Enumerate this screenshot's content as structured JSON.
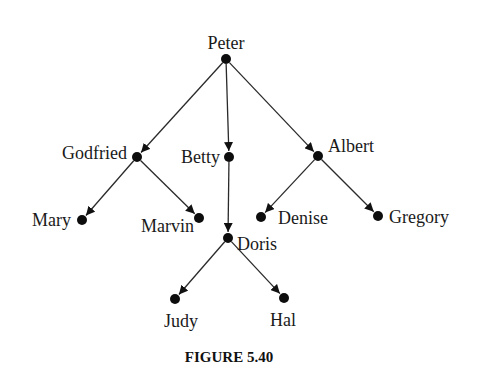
{
  "diagram": {
    "type": "tree",
    "caption": "FIGURE 5.40",
    "root": "Peter",
    "nodes": [
      {
        "id": "peter",
        "label": "Peter",
        "x": 226,
        "y": 59,
        "lx": 226,
        "ly": 49,
        "anchor": "middle"
      },
      {
        "id": "godfried",
        "label": "Godfried",
        "x": 137,
        "y": 157,
        "lx": 127,
        "ly": 159,
        "anchor": "end"
      },
      {
        "id": "betty",
        "label": "Betty",
        "x": 229,
        "y": 157,
        "lx": 220,
        "ly": 163,
        "anchor": "end"
      },
      {
        "id": "albert",
        "label": "Albert",
        "x": 318,
        "y": 156,
        "lx": 328,
        "ly": 152,
        "anchor": "start"
      },
      {
        "id": "mary",
        "label": "Mary",
        "x": 82,
        "y": 220,
        "lx": 71,
        "ly": 226,
        "anchor": "end"
      },
      {
        "id": "marvin",
        "label": "Marvin",
        "x": 199,
        "y": 218,
        "lx": 194,
        "ly": 232,
        "anchor": "end"
      },
      {
        "id": "doris",
        "label": "Doris",
        "x": 228,
        "y": 238,
        "lx": 237,
        "ly": 250,
        "anchor": "start"
      },
      {
        "id": "denise",
        "label": "Denise",
        "x": 261,
        "y": 217,
        "lx": 278,
        "ly": 224,
        "anchor": "start"
      },
      {
        "id": "gregory",
        "label": "Gregory",
        "x": 378,
        "y": 216,
        "lx": 389,
        "ly": 223,
        "anchor": "start"
      },
      {
        "id": "judy",
        "label": "Judy",
        "x": 175,
        "y": 299,
        "lx": 181,
        "ly": 327,
        "anchor": "middle"
      },
      {
        "id": "hal",
        "label": "Hal",
        "x": 284,
        "y": 298,
        "lx": 283,
        "ly": 326,
        "anchor": "middle"
      }
    ],
    "edges": [
      {
        "from": "peter",
        "to": "godfried"
      },
      {
        "from": "peter",
        "to": "betty"
      },
      {
        "from": "peter",
        "to": "albert"
      },
      {
        "from": "godfried",
        "to": "mary"
      },
      {
        "from": "godfried",
        "to": "marvin"
      },
      {
        "from": "betty",
        "to": "doris"
      },
      {
        "from": "albert",
        "to": "denise"
      },
      {
        "from": "albert",
        "to": "gregory"
      },
      {
        "from": "doris",
        "to": "judy"
      },
      {
        "from": "doris",
        "to": "hal"
      }
    ],
    "caption_pos": {
      "x": 229,
      "y": 362
    }
  }
}
